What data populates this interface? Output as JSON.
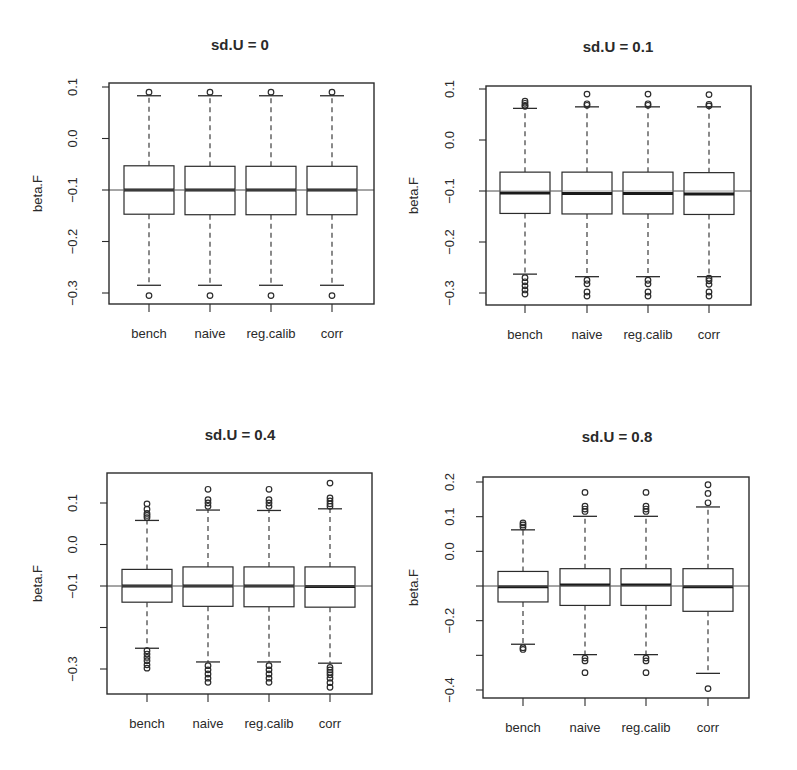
{
  "figure": {
    "ylabel": "beta.F",
    "categories": [
      "bench",
      "naive",
      "reg.calib",
      "corr"
    ]
  },
  "chart_data": [
    {
      "type": "boxplot",
      "title": "sd.U =  0",
      "xlabel": "",
      "ylabel": "beta.F",
      "categories": [
        "bench",
        "naive",
        "reg.calib",
        "corr"
      ],
      "yticks": [
        0.1,
        0.0,
        -0.1,
        -0.2,
        -0.3
      ],
      "ytick_labels": [
        "0.1",
        "0.0",
        "-0.1",
        "-0.2",
        "-0.3"
      ],
      "ylim": [
        -0.32,
        0.108
      ],
      "reference_line": -0.1,
      "grid": false,
      "series": [
        {
          "name": "bench",
          "whisker_low": -0.285,
          "q1": -0.147,
          "median": -0.1,
          "q3": -0.053,
          "whisker_high": 0.083,
          "outliers": [
            0.09,
            -0.305
          ]
        },
        {
          "name": "naive",
          "whisker_low": -0.285,
          "q1": -0.148,
          "median": -0.1,
          "q3": -0.054,
          "whisker_high": 0.083,
          "outliers": [
            0.09,
            -0.305
          ]
        },
        {
          "name": "reg.calib",
          "whisker_low": -0.285,
          "q1": -0.148,
          "median": -0.1,
          "q3": -0.054,
          "whisker_high": 0.083,
          "outliers": [
            0.09,
            -0.305
          ]
        },
        {
          "name": "corr",
          "whisker_low": -0.285,
          "q1": -0.148,
          "median": -0.1,
          "q3": -0.054,
          "whisker_high": 0.083,
          "outliers": [
            0.09,
            -0.305
          ]
        }
      ]
    },
    {
      "type": "boxplot",
      "title": "sd.U =  0.1",
      "xlabel": "",
      "ylabel": "beta.F",
      "categories": [
        "bench",
        "naive",
        "reg.calib",
        "corr"
      ],
      "yticks": [
        0.1,
        0.0,
        -0.1,
        -0.2,
        -0.3
      ],
      "ytick_labels": [
        "0.1",
        "0.0",
        "-0.1",
        "-0.2",
        "-0.3"
      ],
      "ylim": [
        -0.325,
        0.106
      ],
      "reference_line": -0.1,
      "grid": false,
      "series": [
        {
          "name": "bench",
          "whisker_low": -0.263,
          "q1": -0.144,
          "median": -0.104,
          "q3": -0.063,
          "whisker_high": 0.062,
          "outliers": [
            0.066,
            0.068,
            0.072,
            0.076,
            -0.27,
            -0.278,
            -0.286,
            -0.294,
            -0.302
          ]
        },
        {
          "name": "naive",
          "whisker_low": -0.268,
          "q1": -0.145,
          "median": -0.105,
          "q3": -0.063,
          "whisker_high": 0.065,
          "outliers": [
            0.068,
            0.071,
            0.09,
            -0.275,
            -0.282,
            -0.298,
            -0.306
          ]
        },
        {
          "name": "reg.calib",
          "whisker_low": -0.268,
          "q1": -0.145,
          "median": -0.105,
          "q3": -0.063,
          "whisker_high": 0.065,
          "outliers": [
            0.068,
            0.071,
            0.09,
            -0.275,
            -0.282,
            -0.298,
            -0.306
          ]
        },
        {
          "name": "corr",
          "whisker_low": -0.268,
          "q1": -0.146,
          "median": -0.106,
          "q3": -0.064,
          "whisker_high": 0.065,
          "outliers": [
            0.067,
            0.07,
            0.089,
            -0.271,
            -0.276,
            -0.283,
            -0.298,
            -0.306
          ]
        }
      ]
    },
    {
      "type": "boxplot",
      "title": "sd.U =  0.4",
      "xlabel": "",
      "ylabel": "beta.F",
      "categories": [
        "bench",
        "naive",
        "reg.calib",
        "corr"
      ],
      "yticks": [
        0.1,
        0.0,
        -0.1,
        -0.2,
        -0.3
      ],
      "ytick_labels": [
        "0.1",
        "0.0",
        "-0.1",
        "",
        "-0.3"
      ],
      "ylim": [
        -0.363,
        0.17
      ],
      "reference_line": -0.1,
      "grid": false,
      "series": [
        {
          "name": "bench",
          "whisker_low": -0.25,
          "q1": -0.139,
          "median": -0.1,
          "q3": -0.06,
          "whisker_high": 0.058,
          "outliers": [
            0.065,
            0.07,
            0.075,
            0.085,
            0.098,
            -0.256,
            -0.264,
            -0.272,
            -0.28,
            -0.29,
            -0.298
          ]
        },
        {
          "name": "naive",
          "whisker_low": -0.283,
          "q1": -0.149,
          "median": -0.1,
          "q3": -0.054,
          "whisker_high": 0.083,
          "outliers": [
            0.092,
            0.1,
            0.108,
            0.133,
            -0.292,
            -0.302,
            -0.312,
            -0.322,
            -0.332
          ]
        },
        {
          "name": "reg.calib",
          "whisker_low": -0.283,
          "q1": -0.15,
          "median": -0.1,
          "q3": -0.054,
          "whisker_high": 0.082,
          "outliers": [
            0.092,
            0.1,
            0.108,
            0.133,
            -0.292,
            -0.302,
            -0.312,
            -0.322,
            -0.332
          ]
        },
        {
          "name": "corr",
          "whisker_low": -0.286,
          "q1": -0.151,
          "median": -0.101,
          "q3": -0.054,
          "whisker_high": 0.086,
          "outliers": [
            0.092,
            0.098,
            0.105,
            0.112,
            0.148,
            -0.296,
            -0.302,
            -0.308,
            -0.314,
            -0.322,
            -0.333,
            -0.344
          ]
        }
      ]
    },
    {
      "type": "boxplot",
      "title": "sd.U =  0.8",
      "xlabel": "",
      "ylabel": "beta.F",
      "categories": [
        "bench",
        "naive",
        "reg.calib",
        "corr"
      ],
      "yticks": [
        0.2,
        0.1,
        0.0,
        -0.1,
        -0.2,
        -0.3,
        -0.4
      ],
      "ytick_labels": [
        "0.2",
        "0.1",
        "0.0",
        "",
        "-0.2",
        "",
        "-0.4"
      ],
      "ylim": [
        -0.42,
        0.22
      ],
      "reference_line": -0.1,
      "grid": false,
      "series": [
        {
          "name": "bench",
          "whisker_low": -0.268,
          "q1": -0.146,
          "median": -0.102,
          "q3": -0.058,
          "whisker_high": 0.062,
          "outliers": [
            0.07,
            0.076,
            0.082,
            -0.278,
            -0.283
          ]
        },
        {
          "name": "naive",
          "whisker_low": -0.298,
          "q1": -0.156,
          "median": -0.097,
          "q3": -0.05,
          "whisker_high": 0.101,
          "outliers": [
            0.115,
            0.122,
            0.13,
            0.17,
            -0.308,
            -0.316,
            -0.35
          ]
        },
        {
          "name": "reg.calib",
          "whisker_low": -0.298,
          "q1": -0.156,
          "median": -0.097,
          "q3": -0.05,
          "whisker_high": 0.101,
          "outliers": [
            0.115,
            0.122,
            0.13,
            0.17,
            -0.308,
            -0.316,
            -0.35
          ]
        },
        {
          "name": "corr",
          "whisker_low": -0.352,
          "q1": -0.173,
          "median": -0.102,
          "q3": -0.05,
          "whisker_high": 0.128,
          "outliers": [
            0.14,
            0.167,
            0.192,
            -0.396
          ]
        }
      ]
    }
  ],
  "layout": {
    "panels": [
      {
        "frame": [
          109,
          83,
          374,
          304
        ],
        "xticks_px": [
          149,
          210,
          271,
          332
        ],
        "title_pos": [
          240,
          50
        ],
        "ylabel_x": 42,
        "ytick_label_x": 74
      },
      {
        "frame": [
          486,
          86,
          751,
          305
        ],
        "xticks_px": [
          525,
          587,
          648,
          709
        ],
        "title_pos": [
          618,
          52
        ],
        "ylabel_x": 418,
        "ytick_label_x": 451
      },
      {
        "frame": [
          107,
          473,
          372,
          694
        ],
        "xticks_px": [
          147,
          208,
          269,
          330
        ],
        "title_pos": [
          240,
          440
        ],
        "ylabel_x": 42,
        "ytick_label_x": 74
      },
      {
        "frame": [
          483,
          477,
          749,
          698
        ],
        "xticks_px": [
          523,
          585,
          646,
          708
        ],
        "title_pos": [
          617,
          442
        ],
        "ylabel_x": 418,
        "ytick_label_x": 451
      }
    ],
    "tick_px": [
      {
        "ref_values": [
          0.1,
          -0.3
        ],
        "ref_px": [
          87,
          293
        ]
      },
      {
        "ref_values": [
          0.1,
          -0.3
        ],
        "ref_px": [
          89,
          293
        ]
      },
      {
        "ref_values": [
          0.1,
          -0.3
        ],
        "ref_px": [
          503,
          669
        ]
      },
      {
        "ref_values": [
          0.2,
          -0.4
        ],
        "ref_px": [
          482,
          690
        ]
      }
    ],
    "box_half_width": 25
  }
}
